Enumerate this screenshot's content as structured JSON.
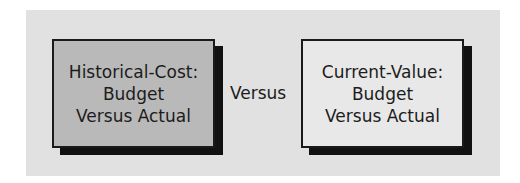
{
  "diagram": {
    "left_box": {
      "lines": [
        "Historical-Cost:",
        "Budget",
        "Versus Actual"
      ],
      "fill_color": "#b9b9b9"
    },
    "connector_label": "Versus",
    "right_box": {
      "lines": [
        "Current-Value:",
        "Budget",
        "Versus Actual"
      ],
      "fill_color": "#e8e8e8"
    },
    "panel_color": "#e1e1e1",
    "shadow_color": "#111111"
  }
}
